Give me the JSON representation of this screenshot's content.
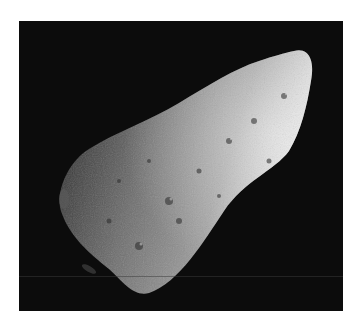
{
  "caption": "",
  "photo": {
    "subject": "asteroid",
    "background_color": "#0c0c0c",
    "surface_light": "#e8e8e8",
    "surface_mid": "#8a8a8a",
    "surface_dark": "#3a3a3a"
  }
}
